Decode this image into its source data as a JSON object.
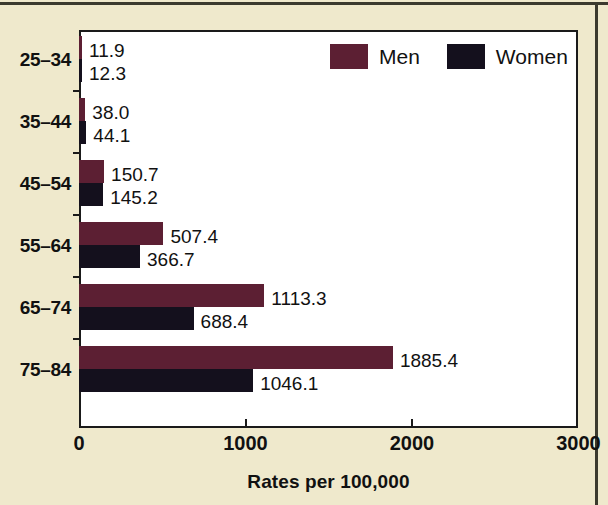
{
  "chart_data": {
    "type": "bar",
    "orientation": "horizontal",
    "title": "",
    "xlabel": "Rates per 100,000",
    "ylabel": "",
    "xlim": [
      0,
      3000
    ],
    "xticks": [
      0,
      1000,
      2000,
      3000
    ],
    "xtick_labels": [
      "0",
      "1000",
      "2000",
      "3000"
    ],
    "grid": false,
    "legend_position": "top-right-inside",
    "categories": [
      "25–34",
      "35–44",
      "45–54",
      "55–64",
      "65–74",
      "75–84"
    ],
    "series": [
      {
        "name": "Men",
        "color": "#5C1F33",
        "values": [
          11.9,
          38.0,
          150.7,
          507.4,
          1113.3,
          1885.4
        ],
        "value_labels": [
          "11.9",
          "38.0",
          "150.7",
          "507.4",
          "1113.3",
          "1885.4"
        ]
      },
      {
        "name": "Women",
        "color": "#14101D",
        "values": [
          12.3,
          44.1,
          145.2,
          366.7,
          688.4,
          1046.1
        ],
        "value_labels": [
          "12.3",
          "44.1",
          "145.2",
          "366.7",
          "688.4",
          "1046.1"
        ]
      }
    ]
  },
  "legend": {
    "items": [
      {
        "label": "Men",
        "swatch_class": "men"
      },
      {
        "label": "Women",
        "swatch_class": "women"
      }
    ]
  },
  "colors": {
    "background": "#EFE9CC",
    "plot_background": "#FFFFFF",
    "axis": "#1a1a1a",
    "men": "#5C1F33",
    "women": "#14101D",
    "text": "#111111"
  }
}
